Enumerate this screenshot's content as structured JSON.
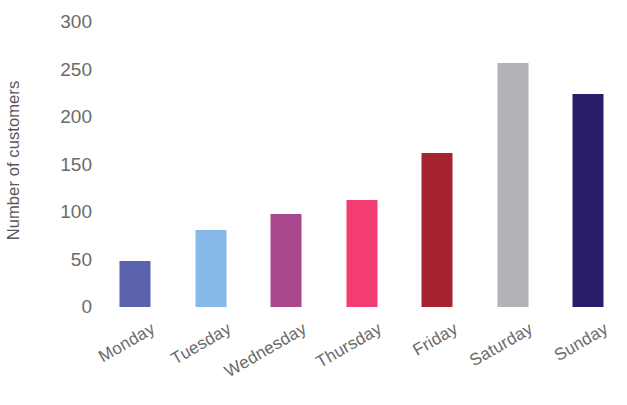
{
  "chart_data": {
    "type": "bar",
    "title": "",
    "subtitle": "",
    "xlabel": "",
    "ylabel": "Number of customers",
    "categories": [
      "Monday",
      "Tuesday",
      "Wednesday",
      "Thursday",
      "Friday",
      "Saturday",
      "Sunday"
    ],
    "values": [
      48,
      81,
      98,
      113,
      162,
      257,
      224
    ],
    "bar_colors": [
      "#5b63ae",
      "#86b8e8",
      "#a8478e",
      "#f33d72",
      "#a62231",
      "#b2b2b7",
      "#2b1b6b"
    ],
    "ylim": [
      0,
      300
    ],
    "yticks": [
      0,
      50,
      100,
      150,
      200,
      250,
      300
    ],
    "ytick_labels": [
      "0",
      "50",
      "100",
      "150",
      "200",
      "250",
      "300"
    ],
    "grid": false,
    "legend": "none",
    "xtick_rotation": -30,
    "axis_lines": false
  }
}
